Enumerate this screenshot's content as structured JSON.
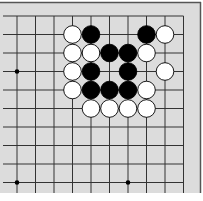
{
  "board": {
    "background": "#dcdcdc",
    "line_color": "#333333",
    "border_color": "#555555",
    "columns_x": [
      17,
      35.5,
      54,
      72.5,
      91,
      109.5,
      128,
      146.5,
      165,
      183.5
    ],
    "rows_y": [
      16,
      34.5,
      53,
      71.5,
      90,
      108.5,
      127,
      145.5,
      164,
      182.5
    ],
    "star_points": [
      [
        0,
        3
      ],
      [
        0,
        9
      ],
      [
        6,
        9
      ]
    ],
    "stones": [
      {
        "col": 3,
        "row": 1,
        "color": "white"
      },
      {
        "col": 4,
        "row": 1,
        "color": "black"
      },
      {
        "col": 7,
        "row": 1,
        "color": "black"
      },
      {
        "col": 8,
        "row": 1,
        "color": "white"
      },
      {
        "col": 3,
        "row": 2,
        "color": "white"
      },
      {
        "col": 4,
        "row": 2,
        "color": "white"
      },
      {
        "col": 5,
        "row": 2,
        "color": "black"
      },
      {
        "col": 6,
        "row": 2,
        "color": "black"
      },
      {
        "col": 7,
        "row": 2,
        "color": "white"
      },
      {
        "col": 3,
        "row": 3,
        "color": "white"
      },
      {
        "col": 4,
        "row": 3,
        "color": "black"
      },
      {
        "col": 6,
        "row": 3,
        "color": "black"
      },
      {
        "col": 8,
        "row": 3,
        "color": "white"
      },
      {
        "col": 3,
        "row": 4,
        "color": "white"
      },
      {
        "col": 4,
        "row": 4,
        "color": "black"
      },
      {
        "col": 5,
        "row": 4,
        "color": "black"
      },
      {
        "col": 6,
        "row": 4,
        "color": "black"
      },
      {
        "col": 7,
        "row": 4,
        "color": "white"
      },
      {
        "col": 4,
        "row": 5,
        "color": "white"
      },
      {
        "col": 5,
        "row": 5,
        "color": "white"
      },
      {
        "col": 6,
        "row": 5,
        "color": "white"
      },
      {
        "col": 7,
        "row": 5,
        "color": "white"
      }
    ]
  }
}
